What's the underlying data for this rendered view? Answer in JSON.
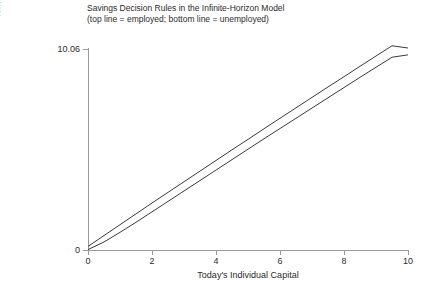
{
  "chart_data": {
    "type": "line",
    "title": "Savings Decision Rules in the Infinite-Horizon Model",
    "subtitle": "(top line = employed; bottom line = unemployed)",
    "xlabel": "Today's Individual Capital",
    "ylabel": "Tomorrow's Individual Capital",
    "xlim": [
      0,
      10
    ],
    "ylim": [
      0,
      10.06
    ],
    "xticks": [
      "0",
      "2",
      "4",
      "6",
      "8",
      "10"
    ],
    "xtick_values": [
      0,
      2,
      4,
      6,
      8,
      10
    ],
    "yticks": [
      "0",
      "10.06"
    ],
    "ytick_values": [
      0,
      10.06
    ],
    "grid": false,
    "legend_position": "none",
    "line_color": "#3a3a3a",
    "axis_color": "#9a9a9a",
    "x": [
      0,
      0.5,
      1,
      1.5,
      2,
      2.5,
      3,
      3.5,
      4,
      4.5,
      5,
      5.5,
      6,
      6.5,
      7,
      7.5,
      8,
      8.5,
      9,
      9.5,
      10
    ],
    "series": [
      {
        "name": "employed",
        "description": "top line = employed",
        "values": [
          0.18,
          0.72,
          1.26,
          1.8,
          2.34,
          2.87,
          3.4,
          3.93,
          4.46,
          4.99,
          5.51,
          6.04,
          6.56,
          7.08,
          7.6,
          8.12,
          8.63,
          9.15,
          9.66,
          10.17,
          10.06
        ]
      },
      {
        "name": "unemployed",
        "description": "bottom line = unemployed",
        "values": [
          0.02,
          0.4,
          0.88,
          1.38,
          1.9,
          2.42,
          2.94,
          3.46,
          3.98,
          4.5,
          5.02,
          5.54,
          6.05,
          6.56,
          7.07,
          7.58,
          8.09,
          8.6,
          9.1,
          9.6,
          9.72
        ]
      }
    ]
  },
  "chart": {
    "title_line1": "Savings Decision Rules in the Infinite-Horizon Model",
    "title_line2": "(top line = employed; bottom line = unemployed)",
    "xlabel": "Today's Individual Capital",
    "ylabel": "Tomorrow's Individual Capital"
  }
}
